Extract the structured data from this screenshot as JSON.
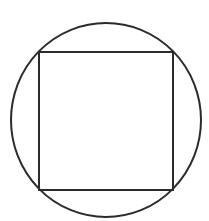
{
  "diagram": {
    "canvas": {
      "width": 209,
      "height": 221,
      "background": "#ffffff"
    },
    "stroke": {
      "color": "#2b2b2b",
      "width": 2
    },
    "circle": {
      "cx": 106,
      "cy": 120,
      "rx": 95,
      "ry": 97
    },
    "square": {
      "x": 39,
      "y": 52,
      "width": 134,
      "height": 138
    },
    "labels": []
  }
}
